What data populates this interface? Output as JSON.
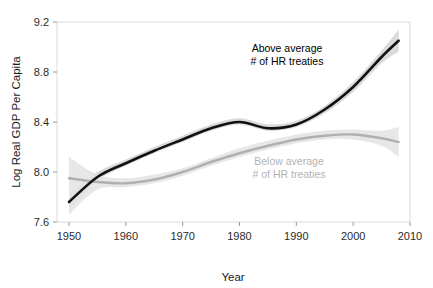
{
  "chart_data": {
    "type": "line",
    "title": "",
    "xlabel": "Year",
    "ylabel": "Log Real GDP Per Capita",
    "xlim": [
      1950,
      2010
    ],
    "ylim": [
      7.6,
      9.2
    ],
    "grid": false,
    "legend_position": "inline-annotation",
    "xticks": [
      "1950",
      "1960",
      "1970",
      "1980",
      "1990",
      "2000",
      "2010"
    ],
    "xtick_values": [
      1950,
      1960,
      1970,
      1980,
      1990,
      2000,
      2010
    ],
    "yticks": [
      "7.6",
      "8.0",
      "8.4",
      "8.8",
      "9.2"
    ],
    "ytick_values": [
      7.6,
      8.0,
      8.4,
      8.8,
      9.2
    ],
    "x": [
      1950,
      1955,
      1960,
      1965,
      1970,
      1975,
      1980,
      1985,
      1990,
      1995,
      2000,
      2005,
      2008
    ],
    "series": [
      {
        "name": "Above average # of HR treaties",
        "color": "#111111",
        "band_color": "#d4d4d4",
        "values": [
          7.76,
          7.96,
          8.07,
          8.17,
          8.26,
          8.35,
          8.4,
          8.35,
          8.38,
          8.5,
          8.68,
          8.92,
          9.05
        ],
        "band_low": [
          7.7,
          7.93,
          8.05,
          8.15,
          8.24,
          8.33,
          8.38,
          8.33,
          8.36,
          8.47,
          8.64,
          8.87,
          8.96
        ],
        "band_high": [
          7.82,
          8.0,
          8.1,
          8.2,
          8.29,
          8.38,
          8.43,
          8.38,
          8.41,
          8.53,
          8.72,
          8.97,
          9.14
        ]
      },
      {
        "name": "Below average # of HR treaties",
        "color": "#b0b0b0",
        "band_color": "#e3e3e3",
        "values": [
          7.95,
          7.92,
          7.91,
          7.94,
          8.0,
          8.08,
          8.15,
          8.21,
          8.26,
          8.29,
          8.3,
          8.27,
          8.24
        ],
        "band_low": [
          7.66,
          7.86,
          7.88,
          7.91,
          7.97,
          8.05,
          8.12,
          8.18,
          8.23,
          8.26,
          8.26,
          8.21,
          8.12
        ],
        "band_high": [
          8.12,
          7.98,
          7.95,
          7.98,
          8.03,
          8.11,
          8.19,
          8.25,
          8.3,
          8.33,
          8.34,
          8.33,
          8.36
        ]
      }
    ],
    "annotations": [
      {
        "id": "above-average-label",
        "line1": "Above average",
        "line2": "# of HR treaties",
        "color": "#000000",
        "x_px": 287,
        "y_px": 52
      },
      {
        "id": "below-average-label",
        "line1": "Below average",
        "line2": "# of HR treaties",
        "color": "#b3b3b3",
        "x_px": 289,
        "y_px": 165
      }
    ]
  },
  "axis": {
    "x_title": "Year",
    "y_title": "Log Real GDP Per Capita",
    "frame_color": "#dadada",
    "tick_color": "#9a9a9a",
    "label_color": "#2b2b2b"
  },
  "colors": {
    "background": "#ffffff",
    "dark_series": "#111111",
    "light_series": "#b0b0b0",
    "dark_band": "#d4d4d4",
    "light_band": "#e3e3e3"
  }
}
